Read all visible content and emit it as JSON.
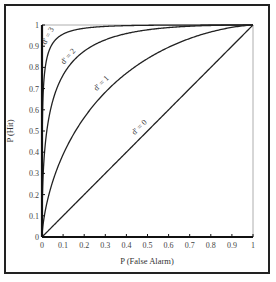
{
  "chart_data": {
    "type": "line",
    "title": "",
    "xlabel": "P (False Alarm)",
    "ylabel": "P (Hit)",
    "xlim": [
      0,
      1
    ],
    "ylim": [
      0,
      1
    ],
    "grid": false,
    "legend": "none (inline curve labels)",
    "x_ticks": [
      "0",
      "0.1",
      "0.2",
      "0.3",
      "0.4",
      "0.5",
      "0.6",
      "0.7",
      "0.8",
      "0.9",
      "1"
    ],
    "y_ticks": [
      "0",
      "0.1",
      "0.2",
      "0.3",
      "0.4",
      "0.5",
      "0.6",
      "0.7",
      "0.8",
      "0.9",
      "1"
    ],
    "x": [
      0,
      0.001,
      0.005,
      0.01,
      0.02,
      0.05,
      0.1,
      0.15,
      0.2,
      0.3,
      0.4,
      0.5,
      0.6,
      0.7,
      0.8,
      0.9,
      1
    ],
    "series": [
      {
        "name": "d' = 3",
        "label": "d' = 3",
        "values": [
          0,
          0.362,
          0.709,
          0.841,
          0.922,
          0.971,
          0.989,
          0.995,
          0.997,
          0.999,
          0.999,
          0.999,
          1.0,
          1.0,
          1.0,
          1.0,
          1
        ]
      },
      {
        "name": "d' = 2",
        "label": "d' = 2",
        "values": [
          0,
          0.0549,
          0.2,
          0.37,
          0.54,
          0.74,
          0.89,
          0.94,
          0.96,
          0.98,
          0.99,
          0.99,
          1.0,
          1.0,
          1.0,
          1.0,
          1
        ]
      },
      {
        "name": "d' = 1",
        "label": "d' = 1",
        "values": [
          0,
          0.006,
          0.034,
          0.077,
          0.16,
          0.26,
          0.39,
          0.48,
          0.56,
          0.68,
          0.77,
          0.84,
          0.89,
          0.94,
          0.97,
          0.99,
          1
        ]
      },
      {
        "name": "d' = 0",
        "label": "d' = 0",
        "values": [
          0,
          0.001,
          0.005,
          0.01,
          0.02,
          0.05,
          0.1,
          0.15,
          0.2,
          0.3,
          0.4,
          0.5,
          0.6,
          0.7,
          0.8,
          0.9,
          1
        ]
      }
    ],
    "annotations": [
      "d' = 3",
      "d' = 2",
      "d' = 1",
      "d' = 0"
    ],
    "colors": {
      "curves": "#222222",
      "axes": "#111111",
      "frame": "#222222",
      "top_right_border": "#aaaaaa"
    }
  },
  "labels": {
    "xlabel": "P (False Alarm)",
    "ylabel": "P (Hit)",
    "curve_d3": "d' = 3",
    "curve_d2": "d' = 2",
    "curve_d1": "d' = 1",
    "curve_d0": "d' = 0"
  }
}
